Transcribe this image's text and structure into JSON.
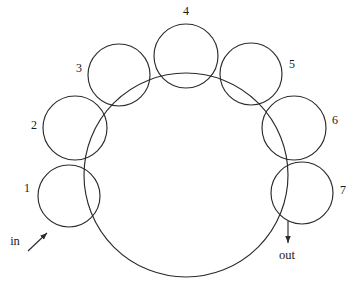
{
  "diagram": {
    "title": "",
    "type": "circle-packing-ring-path",
    "stroke_color": "#2b2b2b",
    "background_color": "#ffffff",
    "main_path": {
      "name": "main-circle",
      "center_x": 186,
      "center_y": 175,
      "radius": 102
    },
    "lobes": [
      {
        "label": "1",
        "cx": 69,
        "cy": 196,
        "r": 31,
        "label_x": 27,
        "label_y": 188
      },
      {
        "label": "2",
        "cx": 75,
        "cy": 128,
        "r": 32,
        "label_x": 34,
        "label_y": 125
      },
      {
        "label": "3",
        "cx": 119,
        "cy": 75,
        "r": 31,
        "label_x": 79,
        "label_y": 68
      },
      {
        "label": "4",
        "cx": 186,
        "cy": 56,
        "r": 32,
        "label_x": 186,
        "label_y": 11
      },
      {
        "label": "5",
        "cx": 251,
        "cy": 74,
        "r": 31,
        "label_x": 292,
        "label_y": 64
      },
      {
        "label": "6",
        "cx": 294,
        "cy": 128,
        "r": 32,
        "label_x": 335,
        "label_y": 120
      },
      {
        "label": "7",
        "cx": 302,
        "cy": 193,
        "r": 31,
        "label_x": 343,
        "label_y": 190
      }
    ],
    "flow_labels": [
      {
        "name": "in-label",
        "text": "in",
        "x": 15,
        "y": 241
      },
      {
        "name": "out-label",
        "text": "out",
        "x": 287,
        "y": 255
      }
    ],
    "arrows": [
      {
        "name": "in-arrow",
        "x1": 28,
        "y1": 251,
        "x2": 47,
        "y2": 233
      },
      {
        "name": "out-arrow",
        "x1": 288,
        "y1": 221,
        "x2": 288,
        "y2": 243
      }
    ]
  }
}
